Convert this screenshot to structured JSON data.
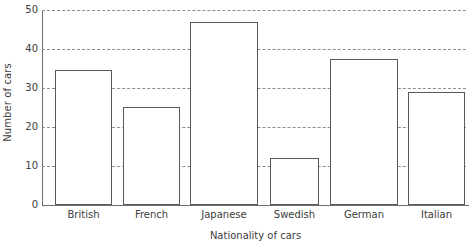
{
  "chart_data": {
    "type": "bar",
    "title": "",
    "xlabel": "Nationality of cars",
    "ylabel": "Number of cars",
    "categories": [
      "British",
      "French",
      "Japanese",
      "Swedish",
      "German",
      "Italian"
    ],
    "values": [
      34.5,
      25,
      47,
      12,
      37.5,
      29
    ],
    "ylim": [
      0,
      50
    ],
    "yticks": [
      0,
      10,
      20,
      30,
      40,
      50
    ],
    "ytick_labels": [
      "0",
      "10",
      "20",
      "30",
      "40",
      "50"
    ],
    "grid": true,
    "grid_style": "dashed",
    "grid_axis": "y",
    "legend": false,
    "bar_fill_color": "#ffffff",
    "bar_edge_color": "#5a5a5a",
    "grid_color": "#8d8d8d",
    "axis_color": "#6e6e6e",
    "text_color": "#3c3c3c",
    "background_color": "#ffffff"
  },
  "axes": {
    "y_title": "Number of cars",
    "x_title": "Nationality of cars",
    "y_ticks": [
      {
        "label": "50",
        "value": 50
      },
      {
        "label": "40",
        "value": 40
      },
      {
        "label": "30",
        "value": 30
      },
      {
        "label": "20",
        "value": 20
      },
      {
        "label": "10",
        "value": 10
      },
      {
        "label": "0",
        "value": 0
      }
    ],
    "x_ticks": [
      {
        "label": "British"
      },
      {
        "label": "French"
      },
      {
        "label": "Japanese"
      },
      {
        "label": "Swedish"
      },
      {
        "label": "German"
      },
      {
        "label": "Italian"
      }
    ]
  },
  "bars": [
    {
      "category": "British",
      "value": 34.5,
      "left_px": 13,
      "width_px": 57
    },
    {
      "category": "French",
      "value": 25,
      "left_px": 81,
      "width_px": 57
    },
    {
      "category": "Japanese",
      "value": 47,
      "left_px": 148,
      "width_px": 68
    },
    {
      "category": "Swedish",
      "value": 12,
      "left_px": 228,
      "width_px": 49
    },
    {
      "category": "German",
      "value": 37.5,
      "left_px": 288,
      "width_px": 68
    },
    {
      "category": "Italian",
      "value": 29,
      "left_px": 366,
      "width_px": 57
    }
  ]
}
